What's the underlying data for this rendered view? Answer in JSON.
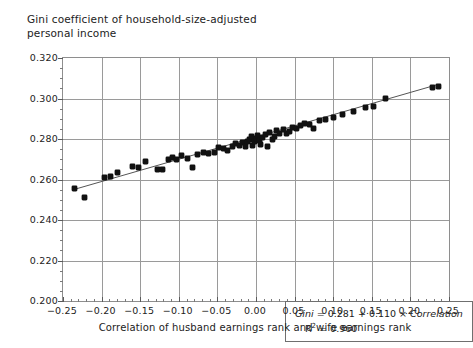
{
  "chart_data": {
    "type": "scatter",
    "title": "Gini coefficient of household-size-adjusted\npersonal income",
    "xlabel": "Correlation of husband earnings rank and wife earnings rank",
    "ylabel": "",
    "xlim": [
      -0.25,
      0.25
    ],
    "ylim": [
      0.2,
      0.32
    ],
    "xticks": [
      -0.25,
      -0.2,
      -0.15,
      -0.1,
      -0.05,
      0.0,
      0.05,
      0.1,
      0.15,
      0.2,
      0.25
    ],
    "xtick_labels": [
      "−0.25",
      "−0.20",
      "−0.15",
      "−0.10",
      "−0.05",
      "0.00",
      "0.05",
      "0.10",
      "0.15",
      "0.20",
      "0.25"
    ],
    "yticks": [
      0.2,
      0.22,
      0.24,
      0.26,
      0.28,
      0.3,
      0.32
    ],
    "ytick_labels": [
      "0.200",
      "0.220",
      "0.240",
      "0.260",
      "0.280",
      "0.300",
      "0.320"
    ],
    "x_minor_step": 0.01,
    "y_minor_step": 0.005,
    "grid": true,
    "grid_axes": "both-major",
    "legend": null,
    "marker_color": "#111111",
    "fitline_color": "#555555",
    "grid_color": "#9a9a9a",
    "annotation": {
      "equation": "Gini = 0.281 + 0.110 × Correlation",
      "equation_parts": {
        "lhs": "Gini",
        "intercept": "0.281",
        "slope": "0.110",
        "regressor": "Correlation"
      },
      "r_squared_label": "R",
      "r_squared_exp": "2",
      "r_squared_value": "= 0.960"
    },
    "fit": {
      "intercept": 0.281,
      "slope": 0.11,
      "r2": 0.96
    },
    "points": [
      [
        -0.235,
        0.2558
      ],
      [
        -0.222,
        0.2513
      ],
      [
        -0.196,
        0.2608
      ],
      [
        -0.189,
        0.2617
      ],
      [
        -0.18,
        0.2633
      ],
      [
        -0.16,
        0.2662
      ],
      [
        -0.152,
        0.266
      ],
      [
        -0.143,
        0.269
      ],
      [
        -0.128,
        0.2648
      ],
      [
        -0.121,
        0.2651
      ],
      [
        -0.113,
        0.27
      ],
      [
        -0.108,
        0.2707
      ],
      [
        -0.103,
        0.2697
      ],
      [
        -0.097,
        0.2718
      ],
      [
        -0.089,
        0.2702
      ],
      [
        -0.082,
        0.266
      ],
      [
        -0.076,
        0.2724
      ],
      [
        -0.068,
        0.2735
      ],
      [
        -0.061,
        0.2727
      ],
      [
        -0.054,
        0.2733
      ],
      [
        -0.048,
        0.2757
      ],
      [
        -0.042,
        0.2753
      ],
      [
        -0.037,
        0.2742
      ],
      [
        -0.031,
        0.2762
      ],
      [
        -0.026,
        0.2776
      ],
      [
        -0.022,
        0.277
      ],
      [
        -0.018,
        0.2782
      ],
      [
        -0.014,
        0.2762
      ],
      [
        -0.011,
        0.279
      ],
      [
        -0.008,
        0.28
      ],
      [
        -0.006,
        0.2812
      ],
      [
        -0.004,
        0.277
      ],
      [
        -0.002,
        0.2788
      ],
      [
        0.0,
        0.2802
      ],
      [
        0.002,
        0.2818
      ],
      [
        0.004,
        0.2793
      ],
      [
        0.006,
        0.2772
      ],
      [
        0.009,
        0.2808
      ],
      [
        0.012,
        0.282
      ],
      [
        0.015,
        0.2762
      ],
      [
        0.018,
        0.2833
      ],
      [
        0.021,
        0.2796
      ],
      [
        0.024,
        0.2812
      ],
      [
        0.027,
        0.284
      ],
      [
        0.031,
        0.2828
      ],
      [
        0.035,
        0.2848
      ],
      [
        0.039,
        0.2826
      ],
      [
        0.043,
        0.2838
      ],
      [
        0.047,
        0.2858
      ],
      [
        0.052,
        0.2852
      ],
      [
        0.058,
        0.2868
      ],
      [
        0.063,
        0.2878
      ],
      [
        0.069,
        0.2872
      ],
      [
        0.075,
        0.2852
      ],
      [
        0.082,
        0.289
      ],
      [
        0.09,
        0.2897
      ],
      [
        0.1,
        0.2908
      ],
      [
        0.112,
        0.292
      ],
      [
        0.126,
        0.2938
      ],
      [
        0.142,
        0.2955
      ],
      [
        0.152,
        0.2962
      ],
      [
        0.168,
        0.2998
      ],
      [
        0.228,
        0.3052
      ],
      [
        0.236,
        0.306
      ]
    ]
  }
}
